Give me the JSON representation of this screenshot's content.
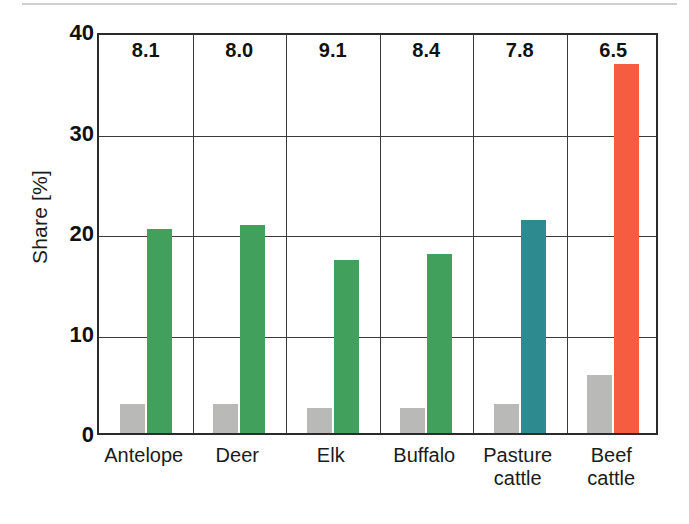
{
  "chart_data": {
    "type": "bar",
    "title": "",
    "subtitle": "",
    "xlabel": "",
    "ylabel": "Share [%]",
    "ylim": [
      0,
      40
    ],
    "yticks": [
      0,
      10,
      20,
      30,
      40
    ],
    "ytick_labels": [
      "0",
      "10",
      "20",
      "30",
      "40"
    ],
    "grid": true,
    "legend": "none",
    "categories": [
      "Antelope",
      "Deer",
      "Elk",
      "Buffalo",
      "Pasture cattle",
      "Beef cattle"
    ],
    "category_labels": [
      [
        "Antelope"
      ],
      [
        "Deer"
      ],
      [
        "Elk"
      ],
      [
        "Buffalo"
      ],
      [
        "Pasture",
        "cattle"
      ],
      [
        "Beef",
        "cattle"
      ]
    ],
    "series": [
      {
        "name": "gray series",
        "color": "#b9b9b7",
        "values": [
          2.9,
          2.9,
          2.5,
          2.5,
          2.9,
          5.8
        ]
      },
      {
        "name": "colored series",
        "colors": [
          "#41a05c",
          "#41a05c",
          "#41a05c",
          "#41a05c",
          "#2d8a8f",
          "#f65c3f"
        ],
        "values": [
          20.3,
          20.7,
          17.2,
          17.8,
          21.2,
          36.7
        ]
      }
    ],
    "annotations": {
      "label": "top-of-panel values",
      "values": [
        "8.1",
        "8.0",
        "9.1",
        "8.4",
        "7.8",
        "6.5"
      ]
    },
    "colors": {
      "green": "#41a05c",
      "teal": "#2d8a8f",
      "red": "#f65c3f",
      "gray": "#b9b9b7",
      "axis": "#2b2b2b",
      "grid": "#3a3a3a",
      "text": "#111111"
    }
  }
}
